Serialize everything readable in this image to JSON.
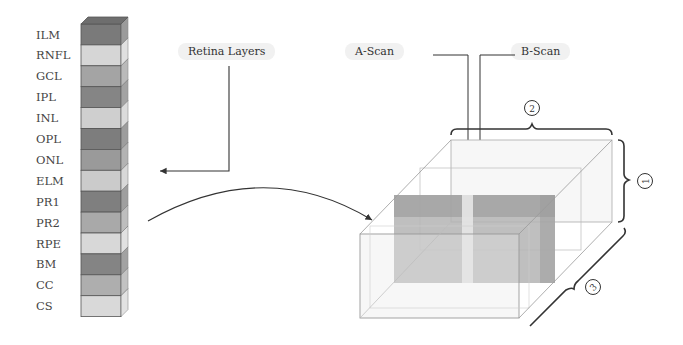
{
  "figure": {
    "labels": {
      "retina_layers": "Retina Layers",
      "a_scan": "A-Scan",
      "b_scan": "B-Scan"
    },
    "dimension_markers": [
      "1",
      "2",
      "3"
    ],
    "layers": [
      {
        "name": "ILM",
        "shade": "#7a7a7a"
      },
      {
        "name": "RNFL",
        "shade": "#d6d6d6"
      },
      {
        "name": "GCL",
        "shade": "#a4a4a4"
      },
      {
        "name": "IPL",
        "shade": "#858585"
      },
      {
        "name": "INL",
        "shade": "#cfcfcf"
      },
      {
        "name": "OPL",
        "shade": "#7d7d7d"
      },
      {
        "name": "ONL",
        "shade": "#9a9a9a"
      },
      {
        "name": "ELM",
        "shade": "#cbcbcb"
      },
      {
        "name": "PR1",
        "shade": "#7f7f7f"
      },
      {
        "name": "PR2",
        "shade": "#a9a9a9"
      },
      {
        "name": "RPE",
        "shade": "#d8d8d8"
      },
      {
        "name": "BM",
        "shade": "#848484"
      },
      {
        "name": "CC",
        "shade": "#aeaeae"
      },
      {
        "name": "CS",
        "shade": "#d9d9d9"
      }
    ]
  }
}
